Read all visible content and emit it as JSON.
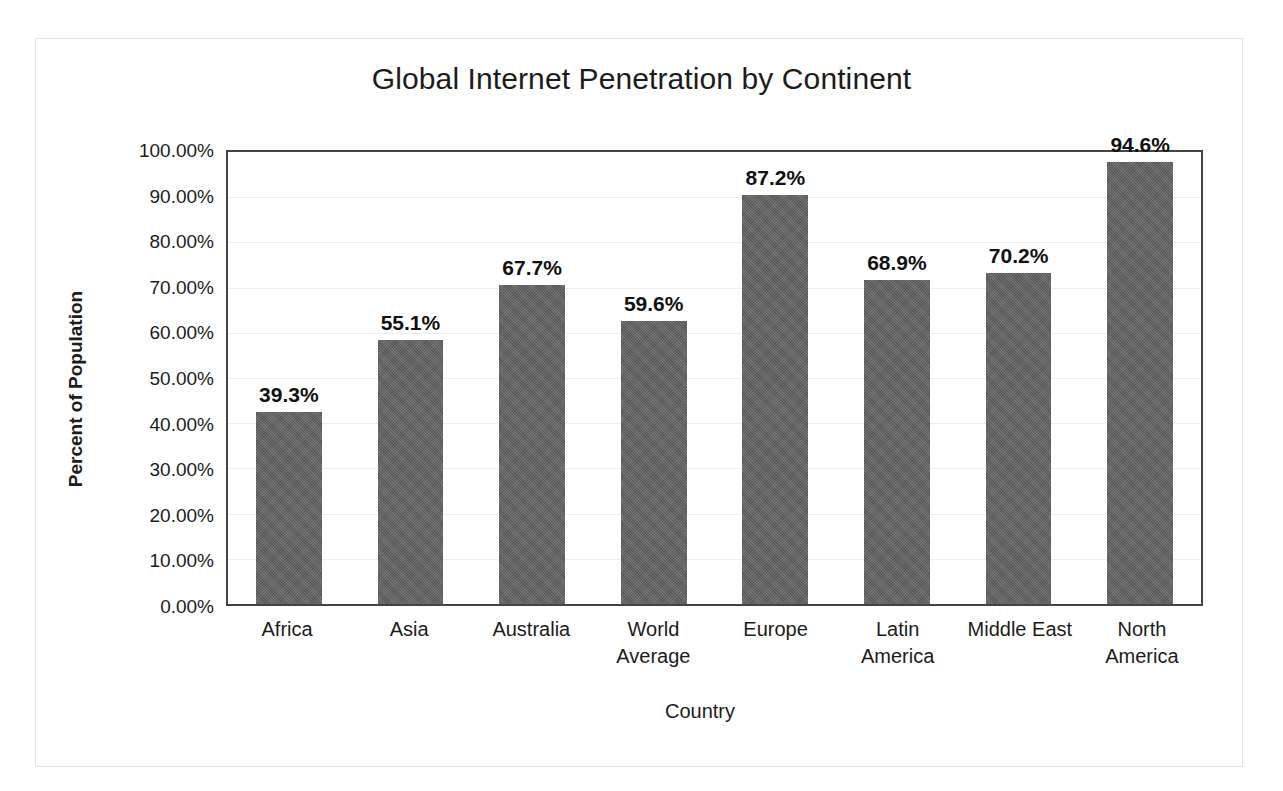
{
  "chart_data": {
    "type": "bar",
    "title": "Global Internet Penetration by Continent",
    "xlabel": "Country",
    "ylabel": "Percent of Population",
    "categories": [
      "Africa",
      "Asia",
      "Australia",
      "World Average",
      "Europe",
      "Latin America",
      "Middle East",
      "North America"
    ],
    "values": [
      39.3,
      55.1,
      67.7,
      59.6,
      87.2,
      68.9,
      70.2,
      94.6
    ],
    "data_labels": [
      "39.3%",
      "55.1%",
      "67.7%",
      "59.6%",
      "87.2%",
      "68.9%",
      "70.2%",
      "94.6%"
    ],
    "bar_pixel_percents": [
      42.5,
      58.3,
      70.6,
      62.7,
      90.4,
      71.7,
      73.2,
      97.8
    ],
    "ylim": [
      0,
      100
    ],
    "ytick_values": [
      0,
      10,
      20,
      30,
      40,
      50,
      60,
      70,
      80,
      90,
      100
    ],
    "ytick_labels": [
      "0.00%",
      "10.00%",
      "20.00%",
      "30.00%",
      "40.00%",
      "50.00%",
      "60.00%",
      "70.00%",
      "80.00%",
      "90.00%",
      "100.00%"
    ],
    "grid": true,
    "legend": "none",
    "bar_color": "#5f5f5f",
    "gridline_color": "#efefef",
    "axis_color": "#444444",
    "text_color": "#1c1c1c",
    "page_border_color": "#e4e4e4",
    "series": [
      {
        "name": "Internet Penetration",
        "values": [
          39.3,
          55.1,
          67.7,
          59.6,
          87.2,
          68.9,
          70.2,
          94.6
        ]
      }
    ]
  },
  "categories_wrapped": [
    [
      "Africa"
    ],
    [
      "Asia"
    ],
    [
      "Australia"
    ],
    [
      "World",
      "Average"
    ],
    [
      "Europe"
    ],
    [
      "Latin",
      "America"
    ],
    [
      "Middle East"
    ],
    [
      "North",
      "America"
    ]
  ]
}
